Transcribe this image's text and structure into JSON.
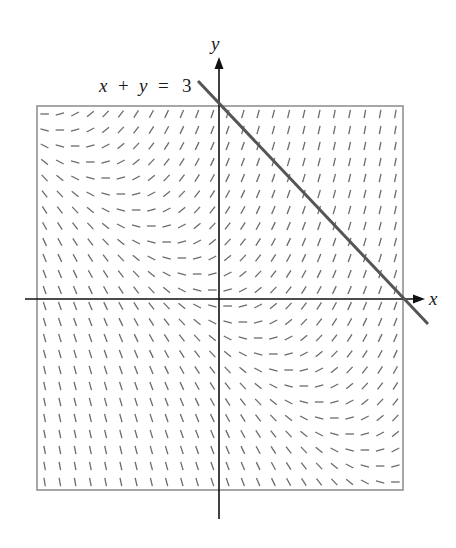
{
  "figure": {
    "equation_label": {
      "x": "x",
      "plus": "+",
      "y": "y",
      "eq": "=",
      "rhs": "3"
    },
    "x_axis_label": "x",
    "y_axis_label": "y"
  },
  "chart_data": {
    "type": "slope_field",
    "differential_equation": "dy/dx = x + y",
    "domain": {
      "x": [
        -3,
        3
      ],
      "y": [
        -3,
        3
      ]
    },
    "grid": {
      "columns": 24,
      "rows": 24,
      "step": 0.25,
      "offset": 0.125
    },
    "overlay_line": {
      "equation": "x + y = 3",
      "label": "x + y = 3"
    },
    "xlabel": "x",
    "ylabel": "y",
    "bounding_box": true
  },
  "colors": {
    "segments": "#6b6b6b",
    "line": "#555555",
    "axes": "#111111",
    "box": "#8a8a8a"
  }
}
